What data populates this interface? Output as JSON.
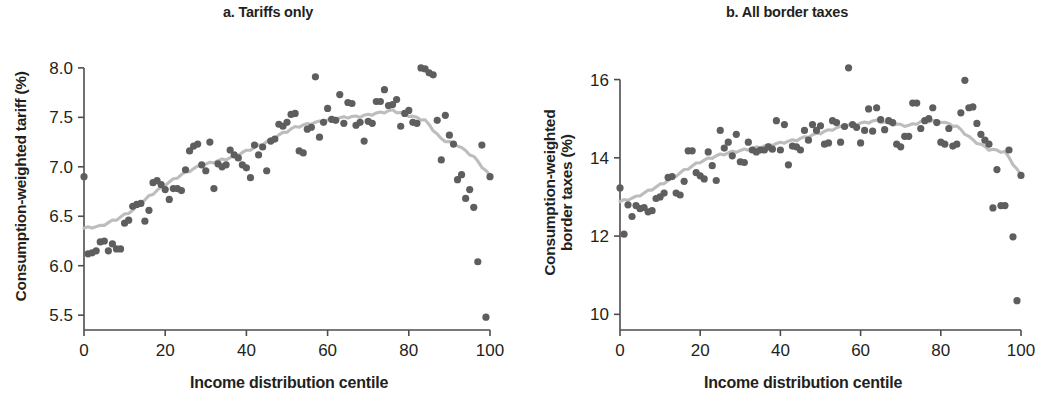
{
  "figure": {
    "background": "#ffffff",
    "dot_color": "#5e5e5e",
    "line_color": "#bdbdbd",
    "axis_color": "#4d4d4d",
    "text_color": "#231f20"
  },
  "panels": [
    {
      "id": "a",
      "title": "a. Tariffs only",
      "xlabel": "Income distribution centile",
      "ylabel_line1": "Consumption-weighted tariff (%)",
      "ylabel_line2": "",
      "xticks": [
        "0",
        "20",
        "40",
        "60",
        "80",
        "100"
      ],
      "yticks": [
        "8.0",
        "7.5",
        "7.0",
        "6.5",
        "6.0",
        "5.5"
      ]
    },
    {
      "id": "b",
      "title": "b. All border taxes",
      "xlabel": "Income distribution centile",
      "ylabel_line1": "Consumption-weighted",
      "ylabel_line2": "border taxes (%)",
      "xticks": [
        "0",
        "20",
        "40",
        "60",
        "80",
        "100"
      ],
      "yticks": [
        "16",
        "14",
        "12",
        "10"
      ]
    }
  ],
  "chart_data": [
    {
      "type": "scatter",
      "panel": "a",
      "title": "a. Tariffs only",
      "xlabel": "Income distribution centile",
      "ylabel": "Consumption-weighted tariff (%)",
      "xlim": [
        0,
        100
      ],
      "ylim": [
        5.35,
        8.1
      ],
      "xticks": [
        0,
        20,
        40,
        60,
        80,
        100
      ],
      "yticks": [
        5.5,
        6.0,
        6.5,
        7.0,
        7.5,
        8.0
      ],
      "grid": false,
      "legend": "none",
      "series": [
        {
          "name": "Consumption-weighted tariff by centile",
          "marker": "circle",
          "color": "#5e5e5e",
          "x": [
            0,
            1,
            2,
            3,
            4,
            5,
            6,
            7,
            8,
            9,
            10,
            11,
            12,
            13,
            14,
            15,
            16,
            17,
            18,
            19,
            20,
            21,
            22,
            23,
            24,
            25,
            26,
            27,
            28,
            29,
            30,
            31,
            32,
            33,
            34,
            35,
            36,
            37,
            38,
            39,
            40,
            41,
            42,
            43,
            44,
            45,
            46,
            47,
            48,
            49,
            50,
            51,
            52,
            53,
            54,
            55,
            56,
            57,
            58,
            59,
            60,
            61,
            62,
            63,
            64,
            65,
            66,
            67,
            68,
            69,
            70,
            71,
            72,
            73,
            74,
            75,
            76,
            77,
            78,
            79,
            80,
            81,
            82,
            83,
            84,
            85,
            86,
            87,
            88,
            89,
            90,
            91,
            92,
            93,
            94,
            95,
            96,
            97,
            98,
            99,
            100
          ],
          "y": [
            6.9,
            6.12,
            6.13,
            6.15,
            6.24,
            6.25,
            6.15,
            6.22,
            6.17,
            6.17,
            6.43,
            6.46,
            6.6,
            6.62,
            6.63,
            6.45,
            6.56,
            6.84,
            6.86,
            6.82,
            6.77,
            6.67,
            6.78,
            6.78,
            6.76,
            6.97,
            7.16,
            7.21,
            7.23,
            7.02,
            6.96,
            7.25,
            6.78,
            7.03,
            7.0,
            7.02,
            7.17,
            7.12,
            7.09,
            7.02,
            6.99,
            6.89,
            7.22,
            7.12,
            7.2,
            6.96,
            7.26,
            7.28,
            7.43,
            7.41,
            7.45,
            7.53,
            7.54,
            7.16,
            7.14,
            7.38,
            7.4,
            7.91,
            7.3,
            7.45,
            7.59,
            7.48,
            7.47,
            7.73,
            7.44,
            7.65,
            7.64,
            7.42,
            7.45,
            7.26,
            7.46,
            7.44,
            7.66,
            7.66,
            7.78,
            7.62,
            7.63,
            7.68,
            7.41,
            7.54,
            7.57,
            7.45,
            7.44,
            8.0,
            7.99,
            7.95,
            7.93,
            7.47,
            7.07,
            7.52,
            7.32,
            7.23,
            6.87,
            6.92,
            6.68,
            6.77,
            6.59,
            6.04,
            7.22,
            5.48,
            6.9
          ]
        },
        {
          "name": "Smoothed trend",
          "type": "line",
          "color": "#bdbdbd",
          "x": [
            0,
            4,
            8,
            12,
            16,
            20,
            24,
            28,
            32,
            36,
            40,
            44,
            48,
            52,
            56,
            60,
            64,
            68,
            72,
            76,
            80,
            84,
            88,
            92,
            96,
            100
          ],
          "y": [
            6.38,
            6.4,
            6.47,
            6.56,
            6.7,
            6.82,
            6.92,
            7.0,
            7.05,
            7.09,
            7.16,
            7.23,
            7.32,
            7.4,
            7.44,
            7.47,
            7.5,
            7.51,
            7.54,
            7.57,
            7.52,
            7.47,
            7.28,
            7.22,
            7.1,
            6.91
          ]
        }
      ]
    },
    {
      "type": "scatter",
      "panel": "b",
      "title": "b. All border taxes",
      "xlabel": "Income distribution centile",
      "ylabel": "Consumption-weighted border taxes (%)",
      "xlim": [
        0,
        100
      ],
      "ylim": [
        9.6,
        16.5
      ],
      "xticks": [
        0,
        20,
        40,
        60,
        80,
        100
      ],
      "yticks": [
        10,
        12,
        14,
        16
      ],
      "grid": false,
      "legend": "none",
      "series": [
        {
          "name": "Consumption-weighted border taxes by centile",
          "marker": "circle",
          "color": "#5e5e5e",
          "x": [
            0,
            1,
            2,
            3,
            4,
            5,
            6,
            7,
            8,
            9,
            10,
            11,
            12,
            13,
            14,
            15,
            16,
            17,
            18,
            19,
            20,
            21,
            22,
            23,
            24,
            25,
            26,
            27,
            28,
            29,
            30,
            31,
            32,
            33,
            34,
            35,
            36,
            37,
            38,
            39,
            40,
            41,
            42,
            43,
            44,
            45,
            46,
            47,
            48,
            49,
            50,
            51,
            52,
            53,
            54,
            55,
            56,
            57,
            58,
            59,
            60,
            61,
            62,
            63,
            64,
            65,
            66,
            67,
            68,
            69,
            70,
            71,
            72,
            73,
            74,
            75,
            76,
            77,
            78,
            79,
            80,
            81,
            82,
            83,
            84,
            85,
            86,
            87,
            88,
            89,
            90,
            91,
            92,
            93,
            94,
            95,
            96,
            97,
            98,
            99,
            100
          ],
          "y": [
            13.23,
            12.05,
            12.8,
            12.5,
            12.78,
            12.7,
            12.73,
            12.62,
            12.65,
            12.96,
            13.0,
            13.1,
            13.5,
            13.52,
            13.1,
            13.05,
            13.4,
            14.18,
            14.18,
            13.62,
            13.54,
            13.46,
            14.15,
            13.8,
            13.42,
            14.7,
            14.25,
            14.4,
            14.05,
            14.6,
            13.9,
            13.88,
            14.4,
            14.2,
            14.15,
            14.2,
            14.2,
            14.28,
            14.22,
            14.95,
            14.2,
            14.85,
            13.82,
            14.3,
            14.28,
            14.2,
            14.7,
            14.45,
            14.85,
            14.7,
            14.82,
            14.35,
            14.38,
            14.95,
            14.9,
            14.4,
            14.8,
            16.3,
            14.85,
            14.78,
            14.38,
            14.7,
            15.25,
            14.68,
            15.28,
            14.98,
            14.72,
            14.95,
            14.9,
            14.35,
            14.28,
            14.55,
            14.55,
            15.4,
            15.4,
            14.75,
            14.95,
            15.0,
            15.28,
            14.9,
            14.4,
            14.35,
            14.75,
            14.3,
            14.35,
            15.15,
            15.98,
            15.28,
            15.3,
            14.88,
            14.6,
            14.45,
            14.35,
            12.72,
            13.7,
            12.78,
            12.78,
            14.2,
            11.98,
            10.35,
            13.55
          ]
        },
        {
          "name": "Smoothed trend",
          "type": "line",
          "color": "#bdbdbd",
          "x": [
            0,
            4,
            8,
            12,
            16,
            20,
            24,
            28,
            32,
            36,
            40,
            44,
            48,
            52,
            56,
            60,
            64,
            68,
            72,
            76,
            80,
            84,
            88,
            92,
            96,
            100
          ],
          "y": [
            12.88,
            13.0,
            13.2,
            13.42,
            13.68,
            13.9,
            14.05,
            14.15,
            14.22,
            14.3,
            14.38,
            14.46,
            14.58,
            14.7,
            14.82,
            14.88,
            14.95,
            14.86,
            14.82,
            14.95,
            14.93,
            14.8,
            14.45,
            14.22,
            14.15,
            13.55
          ]
        }
      ]
    }
  ]
}
